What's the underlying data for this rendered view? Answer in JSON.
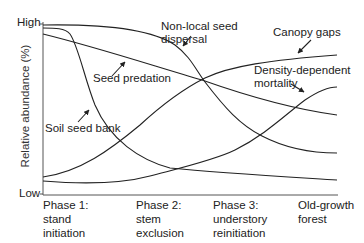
{
  "axis": {
    "y_label": "Relative abundance (%)",
    "y_high": "High",
    "y_low": "Low"
  },
  "phases": [
    {
      "label": "Phase 1:\nstand\ninitiation"
    },
    {
      "label": "Phase 2:\nstem\nexclusion"
    },
    {
      "label": "Phase 3:\nunderstory\nreinitiation"
    },
    {
      "label": "Old-growth\nforest"
    }
  ],
  "curves": [
    {
      "name": "Non-local seed dispersal",
      "label": "Non-local seed\ndispersal",
      "trend": "high then declining"
    },
    {
      "name": "Canopy gaps",
      "label": "Canopy gaps",
      "trend": "increasing"
    },
    {
      "name": "Seed predation",
      "label": "Seed predation",
      "trend": "gradual decline"
    },
    {
      "name": "Density-dependent mortality",
      "label": "Density-dependent\nmortality",
      "trend": "low then increasing"
    },
    {
      "name": "Soil seed bank",
      "label": "Soil seed bank",
      "trend": "sharp early decline"
    }
  ],
  "colors": {
    "line": "#222222",
    "axis": "#555555",
    "text": "#222222"
  }
}
